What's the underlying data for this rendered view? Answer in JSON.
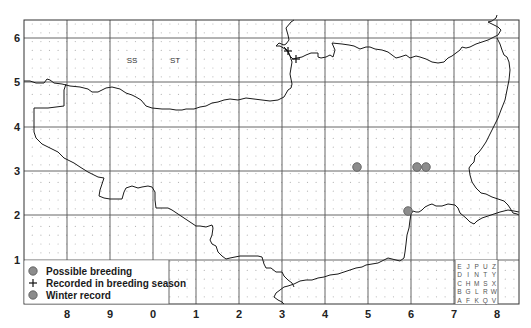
{
  "map": {
    "title": "",
    "frame": {
      "left": 24,
      "top": 20,
      "right": 519,
      "bottom": 304
    },
    "x_axis": {
      "labels": [
        "8",
        "9",
        "0",
        "1",
        "2",
        "3",
        "4",
        "5",
        "6",
        "7",
        "8"
      ],
      "positions": [
        67,
        110,
        153,
        196,
        239,
        282,
        325,
        368,
        411,
        454,
        497
      ]
    },
    "y_axis": {
      "labels": [
        "6",
        "5",
        "4",
        "3",
        "2",
        "1"
      ],
      "positions": [
        38,
        82,
        127,
        171,
        215,
        260
      ]
    },
    "grid_square_labels": [
      {
        "text": "SS",
        "x": 132,
        "y": 63
      },
      {
        "text": "ST",
        "x": 175,
        "y": 63
      }
    ],
    "colors": {
      "grid": "#555555",
      "dots": "#b8b8b8",
      "coastline": "#1a1a1a",
      "marker_fill": "#8c8c8c",
      "marker_stroke": "#555555"
    }
  },
  "records": {
    "possible_breeding": [
      {
        "x": 357,
        "y": 167
      },
      {
        "x": 417,
        "y": 167
      },
      {
        "x": 426,
        "y": 167
      },
      {
        "x": 408,
        "y": 211
      }
    ],
    "recorded_in_breeding_season": [
      {
        "x": 288,
        "y": 51
      },
      {
        "x": 296,
        "y": 59
      }
    ],
    "winter_record": []
  },
  "legend": {
    "items": [
      {
        "symbol": "circle",
        "label": "Possible breeding"
      },
      {
        "symbol": "plus",
        "label": "Recorded in breeding season"
      },
      {
        "symbol": "circle",
        "label": "Winter record"
      }
    ]
  },
  "tetrad_key": {
    "rows": [
      [
        "E",
        "J",
        "P",
        "U",
        "Z"
      ],
      [
        "D",
        "I",
        "N",
        "T",
        "Y"
      ],
      [
        "C",
        "H",
        "M",
        "S",
        "X"
      ],
      [
        "B",
        "G",
        "L",
        "R",
        "W"
      ],
      [
        "A",
        "F",
        "K",
        "Q",
        "V"
      ]
    ]
  }
}
